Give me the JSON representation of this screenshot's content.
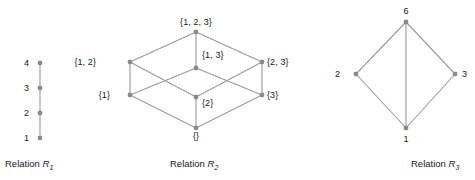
{
  "figure": {
    "background": "#ffffff",
    "node_color": "#8a8a8a",
    "edge_color": "#9a9a9a",
    "text_color": "#1a1a1a"
  },
  "relations": [
    {
      "id": "r1",
      "caption_prefix": "Relation ",
      "caption_symbol": "R",
      "caption_subscript": "1",
      "nodes": [
        {
          "label": "4",
          "x": 40,
          "y": 63,
          "label_x": 24,
          "label_y": 58,
          "label_align": "left"
        },
        {
          "label": "3",
          "x": 40,
          "y": 88,
          "label_x": 24,
          "label_y": 83,
          "label_align": "left"
        },
        {
          "label": "2",
          "x": 40,
          "y": 113,
          "label_x": 24,
          "label_y": 108,
          "label_align": "left"
        },
        {
          "label": "1",
          "x": 40,
          "y": 138,
          "label_x": 24,
          "label_y": 133,
          "label_align": "left"
        }
      ],
      "edges": [
        [
          0,
          1
        ],
        [
          1,
          2
        ],
        [
          2,
          3
        ]
      ],
      "caption_x": 5,
      "caption_y": 158
    },
    {
      "id": "r2",
      "caption_prefix": "Relation ",
      "caption_symbol": "R",
      "caption_subscript": "2",
      "nodes": [
        {
          "label": "{1, 2, 3}",
          "x": 196,
          "y": 32,
          "label_x": 196,
          "label_y": 17,
          "label_align": "center"
        },
        {
          "label": "{1, 2}",
          "x": 130,
          "y": 62,
          "label_x": 96,
          "label_y": 57,
          "label_align": "right"
        },
        {
          "label": "{1, 3}",
          "x": 196,
          "y": 68,
          "label_x": 202,
          "label_y": 50,
          "label_align": "left"
        },
        {
          "label": "{2, 3}",
          "x": 262,
          "y": 62,
          "label_x": 267,
          "label_y": 57,
          "label_align": "left"
        },
        {
          "label": "{1}",
          "x": 130,
          "y": 95,
          "label_x": 110,
          "label_y": 90,
          "label_align": "right"
        },
        {
          "label": "{2}",
          "x": 196,
          "y": 97,
          "label_x": 202,
          "label_y": 98,
          "label_align": "left"
        },
        {
          "label": "{3}",
          "x": 262,
          "y": 95,
          "label_x": 267,
          "label_y": 90,
          "label_align": "left"
        },
        {
          "label": "{}",
          "x": 196,
          "y": 128,
          "label_x": 196,
          "label_y": 131,
          "label_align": "center"
        }
      ],
      "edges": [
        [
          0,
          1
        ],
        [
          0,
          2
        ],
        [
          0,
          3
        ],
        [
          1,
          4
        ],
        [
          1,
          5
        ],
        [
          2,
          4
        ],
        [
          2,
          6
        ],
        [
          3,
          5
        ],
        [
          3,
          6
        ],
        [
          4,
          7
        ],
        [
          5,
          7
        ],
        [
          6,
          7
        ]
      ],
      "caption_x": 170,
      "caption_y": 158
    },
    {
      "id": "r3",
      "caption_prefix": "Relation ",
      "caption_symbol": "R",
      "caption_subscript": "3",
      "nodes": [
        {
          "label": "6",
          "x": 406,
          "y": 22,
          "label_x": 406,
          "label_y": 6,
          "label_align": "center"
        },
        {
          "label": "2",
          "x": 356,
          "y": 74,
          "label_x": 340,
          "label_y": 69,
          "label_align": "right"
        },
        {
          "label": "3",
          "x": 455,
          "y": 74,
          "label_x": 462,
          "label_y": 69,
          "label_align": "left"
        },
        {
          "label": "1",
          "x": 406,
          "y": 128,
          "label_x": 406,
          "label_y": 134,
          "label_align": "center"
        }
      ],
      "edges": [
        [
          0,
          1
        ],
        [
          0,
          2
        ],
        [
          0,
          3
        ],
        [
          1,
          3
        ],
        [
          2,
          3
        ]
      ],
      "caption_x": 411,
      "caption_y": 158
    }
  ]
}
